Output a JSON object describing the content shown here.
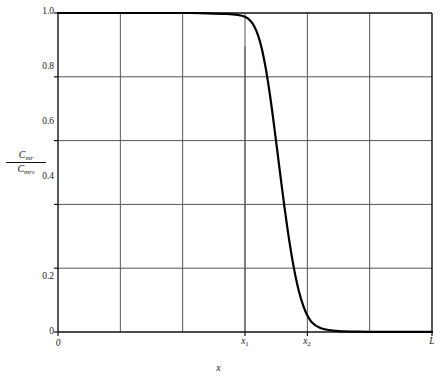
{
  "chart_data": {
    "type": "line",
    "title": "",
    "subtitle": "",
    "xlabel": "x",
    "ylabel_numerator": "C",
    "ylabel_numerator_sub": "mr",
    "ylabel_denominator": "C",
    "ylabel_denominator_sub": "mr",
    "ylabel_denominator_subsub": "o",
    "grid": true,
    "legend": "none",
    "xlim": [
      0,
      1
    ],
    "ylim": [
      0,
      1
    ],
    "x_tick_labels": [
      "0",
      "x₁",
      "x₂",
      "L"
    ],
    "x_tick_positions": [
      0.0,
      0.5,
      0.6667,
      1.0
    ],
    "x_gridline_positions": [
      0.0,
      0.1667,
      0.3333,
      0.5,
      0.6667,
      0.8333,
      1.0
    ],
    "y_tick_labels": [
      "1.0",
      "0.8",
      "0.6",
      "0.4",
      "0.2",
      "0"
    ],
    "y_tick_values": [
      1.0,
      0.8,
      0.6,
      0.4,
      0.2,
      0.0
    ],
    "series": [
      {
        "name": "Cmr/Cmr_o profile",
        "color": "#000000",
        "linewidth": 2.2,
        "x": [
          0.0,
          0.05,
          0.1,
          0.15,
          0.2,
          0.25,
          0.3,
          0.35,
          0.4,
          0.45,
          0.48,
          0.5,
          0.515,
          0.525,
          0.535,
          0.545,
          0.555,
          0.565,
          0.575,
          0.585,
          0.595,
          0.605,
          0.615,
          0.625,
          0.635,
          0.645,
          0.655,
          0.665,
          0.68,
          0.7,
          0.72,
          0.75,
          0.8,
          0.85,
          0.9,
          0.95,
          1.0
        ],
        "y": [
          1.0,
          1.0,
          1.0,
          1.0,
          1.0,
          1.0,
          1.0,
          1.0,
          0.999,
          0.997,
          0.994,
          0.988,
          0.975,
          0.958,
          0.93,
          0.888,
          0.83,
          0.757,
          0.672,
          0.58,
          0.487,
          0.396,
          0.312,
          0.238,
          0.175,
          0.124,
          0.085,
          0.056,
          0.029,
          0.013,
          0.007,
          0.003,
          0.001,
          0.0005,
          0.0003,
          0.0002,
          0.0001
        ]
      }
    ],
    "annotations": [
      {
        "name": "x1-partial-gridline",
        "x": 0.5,
        "y_from": 0.0,
        "y_to": 0.895,
        "note": "short vertical rule at x1 extending above the 0.8 gridline"
      }
    ],
    "axis_color": "#3a3a3a",
    "grid_color": "#555555",
    "frame_color": "#111111",
    "background": "#ffffff"
  },
  "axes": {
    "plot_left_px": 58,
    "plot_right_px": 432,
    "plot_top_px": 13,
    "plot_bottom_px": 332
  }
}
